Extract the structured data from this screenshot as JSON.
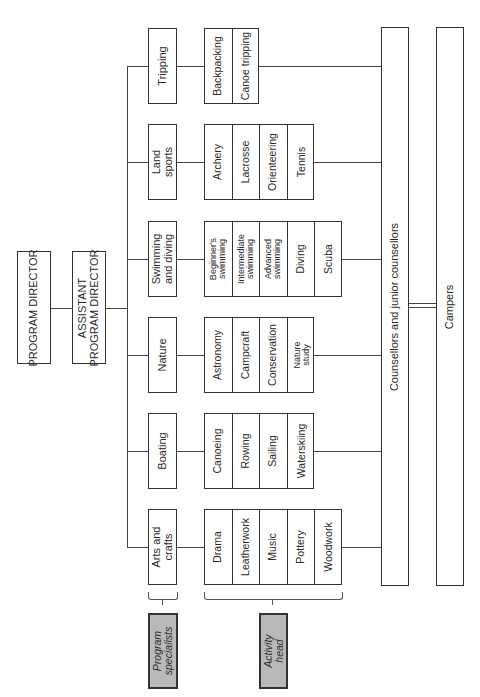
{
  "title_nodes": {
    "program_director": "PROGRAM DIRECTOR",
    "assistant_line1": "ASSISTANT",
    "assistant_line2": "PROGRAM DIRECTOR"
  },
  "programs": [
    {
      "label_line1": "Tripping",
      "label_line2": "",
      "activities": [
        {
          "l1": "Backpacking",
          "l2": ""
        },
        {
          "l1": "Canoe tripping",
          "l2": ""
        }
      ]
    },
    {
      "label_line1": "Land",
      "label_line2": "sports",
      "activities": [
        {
          "l1": "Archery",
          "l2": ""
        },
        {
          "l1": "Lacrosse",
          "l2": ""
        },
        {
          "l1": "Orienteering",
          "l2": ""
        },
        {
          "l1": "Tennis",
          "l2": ""
        }
      ]
    },
    {
      "label_line1": "Swimming",
      "label_line2": "and diving",
      "activities": [
        {
          "l1": "Beginner's",
          "l2": "swimming"
        },
        {
          "l1": "Intermediate",
          "l2": "swimming"
        },
        {
          "l1": "Advanced",
          "l2": "swimming"
        },
        {
          "l1": "Diving",
          "l2": ""
        },
        {
          "l1": "Scuba",
          "l2": ""
        }
      ]
    },
    {
      "label_line1": "Nature",
      "label_line2": "",
      "activities": [
        {
          "l1": "Astronomy",
          "l2": ""
        },
        {
          "l1": "Campcraft",
          "l2": ""
        },
        {
          "l1": "Conservation",
          "l2": ""
        },
        {
          "l1": "Nature",
          "l2": "study"
        }
      ]
    },
    {
      "label_line1": "Boating",
      "label_line2": "",
      "activities": [
        {
          "l1": "Canoeing",
          "l2": ""
        },
        {
          "l1": "Rowing",
          "l2": ""
        },
        {
          "l1": "Sailing",
          "l2": ""
        },
        {
          "l1": "Waterskiing",
          "l2": ""
        }
      ]
    },
    {
      "label_line1": "Arts and",
      "label_line2": "crafts",
      "activities": [
        {
          "l1": "Drama",
          "l2": ""
        },
        {
          "l1": "Leatherwork",
          "l2": ""
        },
        {
          "l1": "Music",
          "l2": ""
        },
        {
          "l1": "Pottery",
          "l2": ""
        },
        {
          "l1": "Woodwork",
          "l2": ""
        }
      ]
    }
  ],
  "counsellors": "Counsellors and junior counsellors",
  "campers": "Campers",
  "legend": {
    "program_specialists_line1": "Program",
    "program_specialists_line2": "specialists",
    "activity_head_line1": "Activity",
    "activity_head_line2": "head"
  },
  "colors": {
    "legend_fill": "#b9b9b9",
    "stroke": "#333333"
  }
}
